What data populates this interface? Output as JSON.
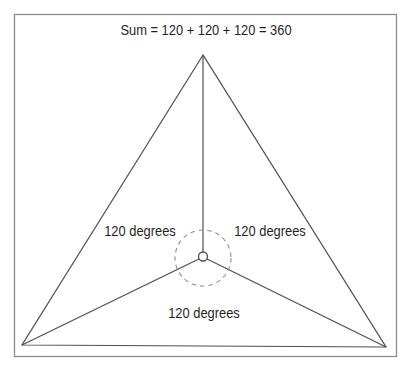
{
  "figure": {
    "title": "Sum = 120 + 120 + 120 = 360",
    "angle_labels": {
      "left": "120 degrees",
      "right": "120 degrees",
      "bottom": "120 degrees"
    },
    "angle_values": [
      120,
      120,
      120
    ],
    "sum": 360,
    "colors": {
      "line": "#4f4f4f",
      "dashed_circle": "#8f8f8f",
      "border": "#8c8c8c",
      "text": "#1f1f1f",
      "background": "#ffffff"
    }
  }
}
